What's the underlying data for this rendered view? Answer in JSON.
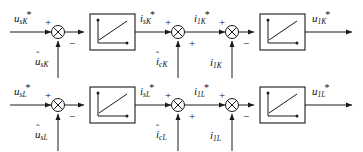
{
  "diagram": {
    "background": "#ffffff",
    "line_color": "#1a1a1a",
    "rows": [
      {
        "id": "row-k",
        "channel": "K",
        "input_label": {
          "base": "u",
          "sub": "sK",
          "star": true,
          "text": "u*sK"
        },
        "feedback_1": {
          "base": "u",
          "sub": "sK",
          "hat": true,
          "text": "ûsK"
        },
        "mid_label_1": {
          "base": "i",
          "sub": "sK",
          "star": true,
          "text": "i*sK"
        },
        "feedback_2": {
          "base": "i",
          "sub": "cK",
          "hat": true,
          "text": "îcK"
        },
        "mid_label_2": {
          "base": "i",
          "sub": "1K",
          "star": true,
          "text": "i*1K"
        },
        "feedback_3": {
          "base": "i",
          "sub": "1K",
          "hat": false,
          "text": "i1K"
        },
        "output_label": {
          "base": "u",
          "sub": "1K",
          "star": true,
          "text": "u*1K"
        },
        "summers": [
          {
            "id": "sum-k-1",
            "sign_in": "+",
            "sign_fb": "−"
          },
          {
            "id": "sum-k-2",
            "sign_in": "+",
            "sign_fb": "+"
          },
          {
            "id": "sum-k-3",
            "sign_in": "+",
            "sign_fb": "−"
          }
        ],
        "blocks": [
          {
            "id": "block-k-1",
            "icon": "saturation-ramp-icon"
          },
          {
            "id": "block-k-2",
            "icon": "saturation-ramp-icon"
          }
        ]
      },
      {
        "id": "row-l",
        "channel": "L",
        "input_label": {
          "base": "u",
          "sub": "sL",
          "star": true,
          "text": "u*sL"
        },
        "feedback_1": {
          "base": "u",
          "sub": "sL",
          "hat": true,
          "text": "ûsL"
        },
        "mid_label_1": {
          "base": "i",
          "sub": "sL",
          "star": true,
          "text": "i*sL"
        },
        "feedback_2": {
          "base": "i",
          "sub": "cL",
          "hat": true,
          "text": "îcL"
        },
        "mid_label_2": {
          "base": "i",
          "sub": "1L",
          "star": true,
          "text": "i*1L"
        },
        "feedback_3": {
          "base": "i",
          "sub": "1L",
          "hat": false,
          "text": "i1L"
        },
        "output_label": {
          "base": "u",
          "sub": "1L",
          "star": true,
          "text": "u*1L"
        },
        "summers": [
          {
            "id": "sum-l-1",
            "sign_in": "+",
            "sign_fb": "−"
          },
          {
            "id": "sum-l-2",
            "sign_in": "+",
            "sign_fb": "+"
          },
          {
            "id": "sum-l-3",
            "sign_in": "+",
            "sign_fb": "−"
          }
        ],
        "blocks": [
          {
            "id": "block-l-1",
            "icon": "saturation-ramp-icon"
          },
          {
            "id": "block-l-2",
            "icon": "saturation-ramp-icon"
          }
        ]
      }
    ],
    "symbols": {
      "summing_junction": "crossed-circle-summer",
      "block_icon": "saturation-ramp-icon",
      "arrowhead": "solid-triangle"
    }
  }
}
